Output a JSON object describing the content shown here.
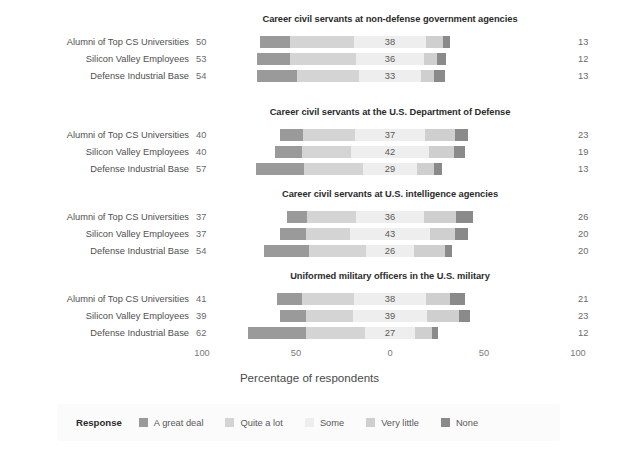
{
  "chart_data": {
    "type": "bar",
    "subtype": "diverging-stacked-bar",
    "title": "",
    "xlabel": "Percentage of respondents",
    "ylabel": "",
    "xlim": [
      -100,
      100
    ],
    "xticks": [
      -100,
      -50,
      0,
      50,
      100
    ],
    "xtick_labels": [
      "100",
      "50",
      "0",
      "50",
      "100"
    ],
    "grid": false,
    "legend_position": "bottom",
    "legend_title": "Response",
    "categories": [
      "A great deal",
      "Quite a lot",
      "Some",
      "Very little",
      "None"
    ],
    "colors": [
      "#9a9a9a",
      "#d4d4d4",
      "#eeeeee",
      "#cfcfcf",
      "#8a8a8a"
    ],
    "groups": [
      "Alumni of Top CS Universities",
      "Silicon Valley Employees",
      "Defense Industrial Base"
    ],
    "panels": [
      {
        "title": "Career civil servants at non-defense government agencies",
        "rows": [
          {
            "group": "Alumni of Top CS Universities",
            "left_total": 50,
            "center": 38,
            "right_total": 13,
            "values": {
              "A great deal": 16,
              "Quite a lot": 34,
              "Some": 38,
              "Very little": 9,
              "None": 4
            }
          },
          {
            "group": "Silicon Valley Employees",
            "left_total": 53,
            "center": 36,
            "right_total": 12,
            "values": {
              "A great deal": 18,
              "Quite a lot": 35,
              "Some": 36,
              "Very little": 7,
              "None": 5
            }
          },
          {
            "group": "Defense Industrial Base",
            "left_total": 54,
            "center": 33,
            "right_total": 13,
            "values": {
              "A great deal": 21,
              "Quite a lot": 33,
              "Some": 33,
              "Very little": 7,
              "None": 6
            }
          }
        ]
      },
      {
        "title": "Career civil servants at the U.S. Department of Defense",
        "rows": [
          {
            "group": "Alumni of Top CS Universities",
            "left_total": 40,
            "center": 37,
            "right_total": 23,
            "values": {
              "A great deal": 12,
              "Quite a lot": 28,
              "Some": 37,
              "Very little": 16,
              "None": 7
            }
          },
          {
            "group": "Silicon Valley Employees",
            "left_total": 40,
            "center": 42,
            "right_total": 19,
            "values": {
              "A great deal": 14,
              "Quite a lot": 26,
              "Some": 42,
              "Very little": 13,
              "None": 6
            }
          },
          {
            "group": "Defense Industrial Base",
            "left_total": 57,
            "center": 29,
            "right_total": 13,
            "values": {
              "A great deal": 26,
              "Quite a lot": 31,
              "Some": 29,
              "Very little": 9,
              "None": 4
            }
          }
        ]
      },
      {
        "title": "Career civil servants at U.S. intelligence agencies",
        "rows": [
          {
            "group": "Alumni of Top CS Universities",
            "left_total": 37,
            "center": 36,
            "right_total": 26,
            "values": {
              "A great deal": 11,
              "Quite a lot": 26,
              "Some": 36,
              "Very little": 17,
              "None": 9
            }
          },
          {
            "group": "Silicon Valley Employees",
            "left_total": 37,
            "center": 43,
            "right_total": 20,
            "values": {
              "A great deal": 14,
              "Quite a lot": 23,
              "Some": 43,
              "Very little": 13,
              "None": 7
            }
          },
          {
            "group": "Defense Industrial Base",
            "left_total": 54,
            "center": 26,
            "right_total": 20,
            "values": {
              "A great deal": 24,
              "Quite a lot": 30,
              "Some": 26,
              "Very little": 16,
              "None": 4
            }
          }
        ]
      },
      {
        "title": "Uniformed military officers in the U.S. military",
        "rows": [
          {
            "group": "Alumni of Top CS Universities",
            "left_total": 41,
            "center": 38,
            "right_total": 21,
            "values": {
              "A great deal": 13,
              "Quite a lot": 28,
              "Some": 38,
              "Very little": 13,
              "None": 8
            }
          },
          {
            "group": "Silicon Valley Employees",
            "left_total": 39,
            "center": 39,
            "right_total": 23,
            "values": {
              "A great deal": 14,
              "Quite a lot": 25,
              "Some": 39,
              "Very little": 17,
              "None": 6
            }
          },
          {
            "group": "Defense Industrial Base",
            "left_total": 62,
            "center": 27,
            "right_total": 12,
            "values": {
              "A great deal": 31,
              "Quite a lot": 31,
              "Some": 27,
              "Very little": 9,
              "None": 3
            }
          }
        ]
      }
    ]
  },
  "legend": {
    "title": "Response",
    "items": [
      {
        "label": "A great deal",
        "color": "#9a9a9a"
      },
      {
        "label": "Quite a lot",
        "color": "#d4d4d4"
      },
      {
        "label": "Some",
        "color": "#eeeeee"
      },
      {
        "label": "Very little",
        "color": "#cfcfcf"
      },
      {
        "label": "None",
        "color": "#8a8a8a"
      }
    ]
  },
  "axis": {
    "title": "Percentage of respondents",
    "ticks": [
      "100",
      "50",
      "0",
      "50",
      "100"
    ]
  }
}
